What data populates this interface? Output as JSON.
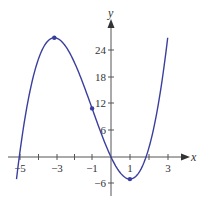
{
  "chart_data": {
    "type": "line",
    "title": "",
    "xlabel": "x",
    "ylabel": "y",
    "function": "y = x^3 + 3x^2 - 9x",
    "x_range": [
      -5,
      3
    ],
    "xlim": [
      -5.5,
      3.8
    ],
    "ylim": [
      -7.5,
      33
    ],
    "x_ticks": [
      -5,
      -4,
      -3,
      -2,
      -1,
      0,
      1,
      2,
      3
    ],
    "x_tick_labels": [
      "-5",
      "-3",
      "-1",
      "1",
      "3"
    ],
    "x_tick_label_values": [
      -5,
      -3,
      -1,
      1,
      3
    ],
    "y_ticks": [
      -6,
      6,
      12,
      18,
      24
    ],
    "y_tick_labels": [
      "-6",
      "6",
      "12",
      "18",
      "24"
    ],
    "grid": false,
    "series": [
      {
        "name": "f(x)",
        "color": "#3a3f9e",
        "x": [
          -5,
          -4.5,
          -4,
          -3.5,
          -3,
          -2.5,
          -2,
          -1.5,
          -1,
          -0.5,
          0,
          0.5,
          1,
          1.5,
          2,
          2.5,
          3
        ],
        "values": [
          -5,
          14.625,
          20,
          25.625,
          27,
          25.625,
          22,
          16.875,
          11,
          5.125,
          0,
          -3.625,
          -5,
          -3.375,
          2,
          11.875,
          27
        ]
      }
    ],
    "marked_points": [
      {
        "x": -3,
        "y": 27,
        "label": "local max"
      },
      {
        "x": -1,
        "y": 11,
        "label": "inflection point"
      },
      {
        "x": 1,
        "y": -5,
        "label": "local min"
      }
    ]
  },
  "axes": {
    "x_name": "x",
    "y_name": "y",
    "x_labels": [
      "−5",
      "−3",
      "−1",
      "1",
      "3"
    ],
    "y_labels": [
      "24",
      "18",
      "12",
      "6",
      "−6"
    ]
  },
  "colors": {
    "curve": "#3a3f9e",
    "axis": "#555555"
  }
}
